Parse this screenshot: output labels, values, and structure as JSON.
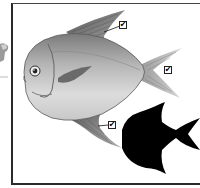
{
  "figure": {
    "colors": {
      "frame": "#2a2a2a",
      "body_light": "#e4e4e4",
      "body_mid": "#b8b8b8",
      "body_dark": "#6e6e6e",
      "fin": "#8a8a8a",
      "silhouette": "#000000",
      "background": "#ffffff"
    },
    "markers": [
      {
        "id": "dorsal-fin",
        "symbol": "✔",
        "label_target": "dorsal fin"
      },
      {
        "id": "tail-fin",
        "symbol": "✔",
        "label_target": "tail fin"
      },
      {
        "id": "anal-fin",
        "symbol": "✔",
        "label_target": "anal fin"
      }
    ],
    "silhouette": "fish-silhouette"
  }
}
